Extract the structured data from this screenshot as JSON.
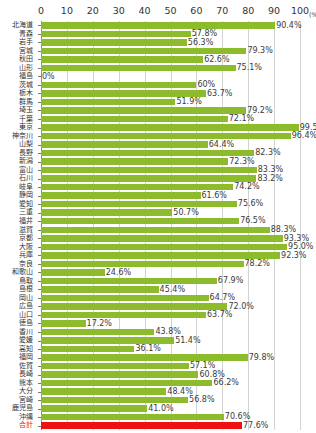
{
  "chart_data": {
    "type": "bar",
    "orientation": "horizontal",
    "title": "",
    "subtitle": "",
    "xlabel": "",
    "ylabel": "",
    "unit": "(%)",
    "xlim": [
      0,
      100
    ],
    "xticks": [
      0,
      10,
      20,
      30,
      40,
      50,
      60,
      70,
      80,
      90,
      100
    ],
    "xtick_labels": [
      "0",
      "10",
      "20",
      "30",
      "40",
      "50",
      "60",
      "70",
      "80",
      "90",
      "100"
    ],
    "grid": true,
    "legend": false,
    "bar_color": "#8cbb2c",
    "total_bar_color": "#ee1111",
    "categories": [
      "北海道",
      "青森",
      "岩手",
      "宮城",
      "秋田",
      "山形",
      "福島",
      "茨城",
      "栃木",
      "群馬",
      "埼玉",
      "千葉",
      "東京",
      "神奈川",
      "山梨",
      "長野",
      "新潟",
      "富山",
      "石川",
      "岐阜",
      "静岡",
      "愛知",
      "三重",
      "福井",
      "滋賀",
      "京都",
      "大阪",
      "兵庫",
      "奈良",
      "和歌山",
      "鳥取",
      "島根",
      "岡山",
      "広島",
      "山口",
      "徳島",
      "香川",
      "愛媛",
      "高知",
      "福岡",
      "佐賀",
      "長崎",
      "熊本",
      "大分",
      "宮崎",
      "鹿児島",
      "沖縄",
      "合計"
    ],
    "values": [
      90.4,
      57.8,
      56.3,
      79.3,
      62.6,
      75.1,
      0,
      60,
      63.7,
      51.9,
      79.2,
      72.1,
      99.5,
      96.4,
      64.4,
      82.3,
      72.3,
      83.3,
      83.2,
      74.2,
      61.6,
      75.6,
      50.7,
      76.5,
      88.3,
      93.3,
      95.0,
      92.3,
      78.2,
      24.6,
      67.9,
      45.4,
      64.7,
      72.0,
      63.7,
      17.2,
      43.8,
      51.4,
      36.1,
      79.8,
      57.1,
      60.8,
      66.2,
      48.4,
      56.8,
      41.0,
      70.6,
      77.6
    ],
    "value_labels": [
      "90.4%",
      "57.8%",
      "56.3%",
      "79.3%",
      "62.6%",
      "75.1%",
      "0%",
      "60%",
      "63.7%",
      "51.9%",
      "79.2%",
      "72.1%",
      "99.5%",
      "96.4%",
      "64.4%",
      "82.3%",
      "72.3%",
      "83.3%",
      "83.2%",
      "74.2%",
      "61.6%",
      "75.6%",
      "50.7%",
      "76.5%",
      "88.3%",
      "93.3%",
      "95.0%",
      "92.3%",
      "78.2%",
      "24.6%",
      "67.9%",
      "45.4%",
      "64.7%",
      "72.0%",
      "63.7%",
      "17.2%",
      "43.8%",
      "51.4%",
      "36.1%",
      "79.8%",
      "57.1%",
      "60.8%",
      "66.2%",
      "48.4%",
      "56.8%",
      "41.0%",
      "70.6%",
      "77.6%"
    ],
    "total_index": 47
  },
  "footer": {
    "note": ""
  }
}
